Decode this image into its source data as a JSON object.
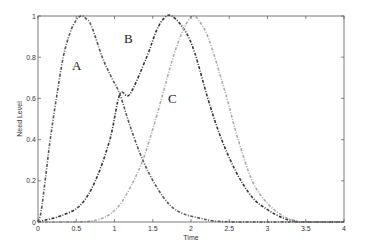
{
  "chart_data": {
    "type": "line",
    "title": "",
    "xlabel": "Time",
    "ylabel": "Need Level",
    "xlim": [
      0,
      4
    ],
    "ylim": [
      0,
      1
    ],
    "grid": false,
    "legend": "none (inline curve labels A, B, C)",
    "xticks": [
      0,
      0.5,
      1,
      1.5,
      2,
      2.5,
      3,
      3.5,
      4
    ],
    "xtick_labels": [
      "0",
      "0.5",
      "1",
      "1.5",
      "2",
      "2.5",
      "3",
      "3.5",
      "4"
    ],
    "yticks": [
      0,
      0.2,
      0.4,
      0.6,
      0.8,
      1
    ],
    "ytick_labels": [
      "0",
      "0.2",
      "0.4",
      "0.6",
      "0.8",
      "1"
    ],
    "annotations": [
      {
        "text": "A",
        "x": 0.5,
        "y": 0.78
      },
      {
        "text": "B",
        "x": 1.2,
        "y": 0.92
      },
      {
        "text": "C",
        "x": 1.78,
        "y": 0.47
      }
    ],
    "series": [
      {
        "name": "A",
        "color": "#555555",
        "style": "dash-dot",
        "x": [
          0,
          0.04,
          0.1,
          0.16,
          0.24,
          0.33,
          0.42,
          0.5,
          0.56,
          0.62,
          0.7,
          0.84,
          0.95,
          1.07,
          1.2,
          1.37,
          1.55,
          1.73,
          1.9,
          2.1,
          2.3,
          2.6,
          3.0,
          3.5,
          4.0
        ],
        "y": [
          0,
          0.05,
          0.22,
          0.4,
          0.6,
          0.8,
          0.92,
          0.98,
          1.0,
          0.99,
          0.95,
          0.8,
          0.71,
          0.62,
          0.47,
          0.3,
          0.17,
          0.08,
          0.04,
          0.02,
          0.005,
          0,
          0,
          0,
          0
        ]
      },
      {
        "name": "B",
        "color": "#333333",
        "style": "dash-dot",
        "x": [
          0,
          0.1,
          0.3,
          0.55,
          0.75,
          0.94,
          1.07,
          1.2,
          1.42,
          1.55,
          1.65,
          1.75,
          1.92,
          2.05,
          2.22,
          2.38,
          2.58,
          2.8,
          3.0,
          3.2,
          3.35,
          3.5,
          4.0
        ],
        "y": [
          0,
          0.01,
          0.03,
          0.08,
          0.2,
          0.4,
          0.62,
          0.62,
          0.8,
          0.93,
          0.99,
          1.0,
          0.93,
          0.82,
          0.6,
          0.42,
          0.25,
          0.12,
          0.06,
          0.02,
          0.005,
          0,
          0
        ]
      },
      {
        "name": "C",
        "color": "#aaaaaa",
        "style": "dash-dot",
        "x": [
          0,
          0.5,
          0.77,
          0.95,
          1.1,
          1.25,
          1.37,
          1.5,
          1.63,
          1.75,
          1.85,
          1.95,
          2.03,
          2.12,
          2.25,
          2.47,
          2.6,
          2.8,
          3.0,
          3.2,
          3.35,
          3.5,
          4.0
        ],
        "y": [
          0,
          0,
          0.01,
          0.04,
          0.1,
          0.2,
          0.3,
          0.45,
          0.62,
          0.78,
          0.89,
          0.97,
          1.0,
          0.97,
          0.87,
          0.6,
          0.42,
          0.2,
          0.09,
          0.03,
          0.008,
          0,
          0
        ]
      }
    ]
  }
}
